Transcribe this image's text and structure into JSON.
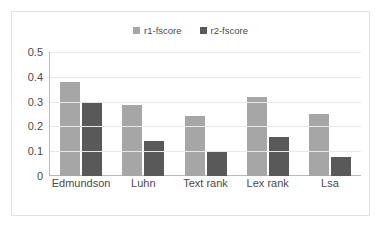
{
  "chart_data": {
    "type": "bar",
    "title": "",
    "subtitle": "",
    "xlabel": "",
    "ylabel": "",
    "categories": [
      "Edmundson",
      "Luhn",
      "Text rank",
      "Lex rank",
      "Lsa"
    ],
    "series": [
      {
        "name": "r1-fscore",
        "color": "#a6a6a6",
        "values": [
          0.38,
          0.285,
          0.24,
          0.32,
          0.25
        ]
      },
      {
        "name": "r2-fscore",
        "color": "#595959",
        "values": [
          0.295,
          0.14,
          0.098,
          0.158,
          0.078
        ]
      }
    ],
    "ylim": [
      0,
      0.5
    ],
    "ytick_labels": [
      "0.5",
      "0.4",
      "0.3",
      "0.2",
      "0.1",
      "0"
    ],
    "ytick_values": [
      0.5,
      0.4,
      0.3,
      0.2,
      0.1,
      0
    ],
    "grid": true,
    "grid_axis": "y",
    "legend_position": "top-center",
    "legend_marker": "square"
  }
}
